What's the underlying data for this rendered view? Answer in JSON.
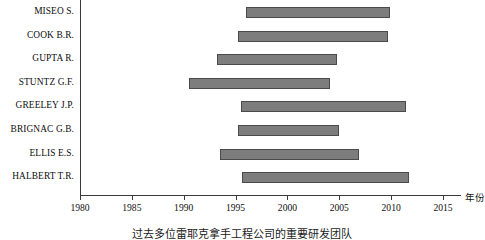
{
  "chart_data": {
    "type": "bar",
    "orientation": "horizontal",
    "subtype": "gantt-range",
    "title": "",
    "xlabel": "年份",
    "ylabel": "",
    "xlim": [
      1980,
      2015
    ],
    "grid": false,
    "legend": null,
    "bar_color": "#7d7d7d",
    "bar_border_color": "#4a4a4a",
    "axis_color": "#3a3a3a",
    "xticks": [
      1980,
      1985,
      1990,
      1995,
      2000,
      2005,
      2010,
      2015
    ],
    "xticklabels": [
      "1980",
      "1985",
      "1990",
      "1995",
      "2000",
      "2005",
      "2010",
      "2015"
    ],
    "categories": [
      "MISEO S.",
      "COOK B.R.",
      "GUPTA R.",
      "STUNTZ G.F.",
      "GREELEY J.P.",
      "BRIGNAC G.B.",
      "ELLIS E.S.",
      "HALBERT T.R."
    ],
    "bars": [
      {
        "label": "MISEO S.",
        "start": 1996.0,
        "end": 2009.9
      },
      {
        "label": "COOK B.R.",
        "start": 1995.2,
        "end": 2009.7
      },
      {
        "label": "GUPTA R.",
        "start": 1993.2,
        "end": 2004.8
      },
      {
        "label": "STUNTZ G.F.",
        "start": 1990.5,
        "end": 2004.1
      },
      {
        "label": "GREELEY J.P.",
        "start": 1995.5,
        "end": 2011.4
      },
      {
        "label": "BRIGNAC G.B.",
        "start": 1995.2,
        "end": 2005.0
      },
      {
        "label": "ELLIS E.S.",
        "start": 1993.5,
        "end": 2006.9
      },
      {
        "label": "HALBERT T.R.",
        "start": 1995.6,
        "end": 2011.7
      }
    ]
  },
  "caption": {
    "text": "过去多位雷耶克拿手工程公司的重要研发团队"
  }
}
